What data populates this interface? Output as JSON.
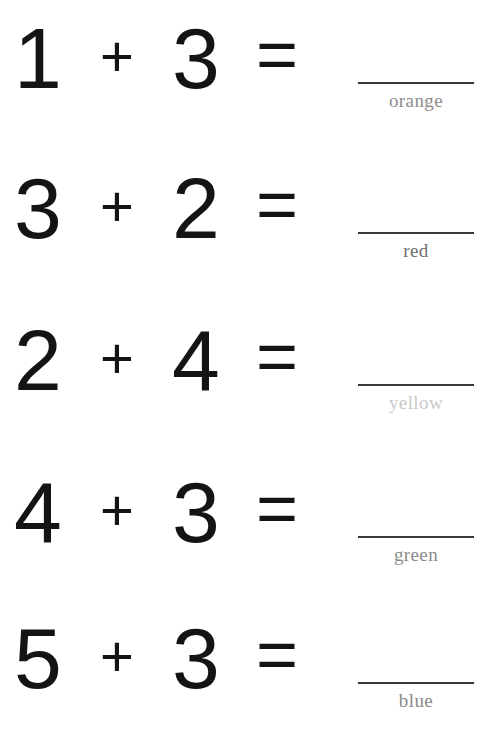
{
  "worksheet": {
    "title": "Addition Color-by-Answer Worksheet",
    "background_color": "#ffffff",
    "digit_color": "#141414",
    "line_color": "#3a3a3a",
    "rows": [
      {
        "addend_a": "1",
        "operator": "+",
        "addend_b": "3",
        "equals": "=",
        "answer": "",
        "color_label": "orange",
        "label_color": "#8c8c8c"
      },
      {
        "addend_a": "3",
        "operator": "+",
        "addend_b": "2",
        "equals": "=",
        "answer": "",
        "color_label": "red",
        "label_color": "#6e6e6e"
      },
      {
        "addend_a": "2",
        "operator": "+",
        "addend_b": "4",
        "equals": "=",
        "answer": "",
        "color_label": "yellow",
        "label_color": "#cacaca"
      },
      {
        "addend_a": "4",
        "operator": "+",
        "addend_b": "3",
        "equals": "=",
        "answer": "",
        "color_label": "green",
        "label_color": "#8a8a8a"
      },
      {
        "addend_a": "5",
        "operator": "+",
        "addend_b": "3",
        "equals": "=",
        "answer": "",
        "color_label": "blue",
        "label_color": "#8a8a8a"
      }
    ]
  }
}
